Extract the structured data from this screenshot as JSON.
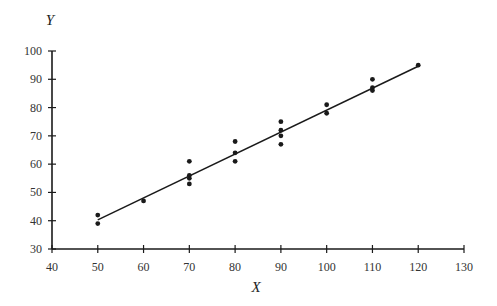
{
  "chart_data": {
    "type": "scatter",
    "title": "",
    "xlabel": "X",
    "ylabel": "Y",
    "xlim": [
      40,
      130
    ],
    "ylim": [
      30,
      100
    ],
    "xticks": [
      40,
      50,
      60,
      70,
      80,
      90,
      100,
      110,
      120,
      130
    ],
    "yticks": [
      30,
      40,
      50,
      60,
      70,
      80,
      90,
      100
    ],
    "grid": false,
    "legend": null,
    "points": [
      {
        "x": 50,
        "y": 42
      },
      {
        "x": 50,
        "y": 39
      },
      {
        "x": 60,
        "y": 47
      },
      {
        "x": 70,
        "y": 61
      },
      {
        "x": 70,
        "y": 56
      },
      {
        "x": 70,
        "y": 55
      },
      {
        "x": 70,
        "y": 53
      },
      {
        "x": 80,
        "y": 68
      },
      {
        "x": 80,
        "y": 64
      },
      {
        "x": 80,
        "y": 61
      },
      {
        "x": 90,
        "y": 75
      },
      {
        "x": 90,
        "y": 72
      },
      {
        "x": 90,
        "y": 70
      },
      {
        "x": 90,
        "y": 67
      },
      {
        "x": 100,
        "y": 81
      },
      {
        "x": 100,
        "y": 78
      },
      {
        "x": 110,
        "y": 90
      },
      {
        "x": 110,
        "y": 87
      },
      {
        "x": 110,
        "y": 86
      },
      {
        "x": 120,
        "y": 95
      }
    ],
    "fit_line": {
      "x1": 50,
      "y1": 40.3,
      "x2": 120,
      "y2": 94.6
    }
  },
  "colors": {
    "ink": "#1a1a1a",
    "text": "#333333"
  }
}
